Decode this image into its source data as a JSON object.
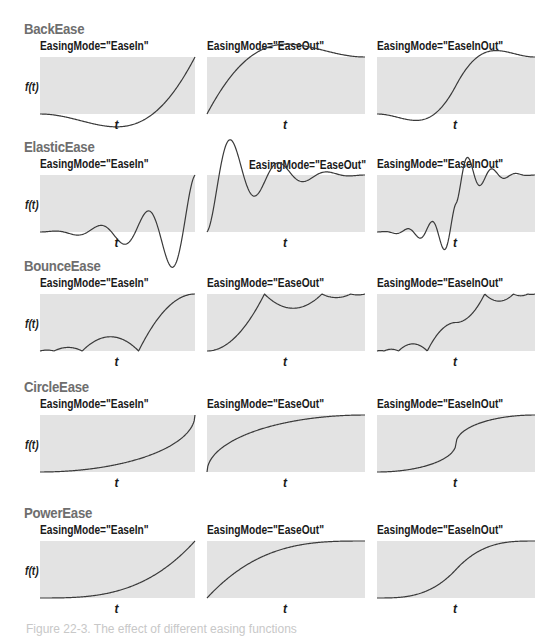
{
  "figure": {
    "y_axis_label": "f(t)",
    "x_axis_label": "t",
    "caption": "Figure 22-3. The effect of different easing functions",
    "colors": {
      "plot_fill": "#e3e3e3",
      "curve": "#3a3a3a",
      "heading": "#6e6e6e"
    }
  },
  "rows": [
    {
      "title": "BackEase",
      "modes": [
        "EasingMode=\"EaseIn\"",
        "EasingMode=\"EaseOut\"",
        "EasingMode=\"EaseInOut\""
      ]
    },
    {
      "title": "ElasticEase",
      "modes": [
        "EasingMode=\"EaseIn\"",
        "EasingMode=\"EaseOut\"",
        "EasingMode=\"EaseInOut\""
      ]
    },
    {
      "title": "BounceEase",
      "modes": [
        "EasingMode=\"EaseIn\"",
        "EasingMode=\"EaseOut\"",
        "EasingMode=\"EaseInOut\""
      ]
    },
    {
      "title": "CircleEase",
      "modes": [
        "EasingMode=\"EaseIn\"",
        "EasingMode=\"EaseOut\"",
        "EasingMode=\"EaseInOut\""
      ]
    },
    {
      "title": "PowerEase",
      "modes": [
        "EasingMode=\"EaseIn\"",
        "EasingMode=\"EaseOut\"",
        "EasingMode=\"EaseInOut\""
      ]
    }
  ],
  "chart_data": {
    "type": "line",
    "title": "Effect of different easing functions",
    "xlabel": "t",
    "ylabel": "f(t)",
    "grid": false,
    "layout": "5 rows (easing function) x 3 columns (EasingMode)",
    "x_range": [
      0,
      1
    ],
    "y_range": [
      0,
      1
    ],
    "series": [
      {
        "name": "BackEase EaseIn",
        "shape": "dips below 0 (~-0.1) then rises to 1"
      },
      {
        "name": "BackEase EaseOut",
        "shape": "rises, overshoots above 1 (~1.1), settles to 1"
      },
      {
        "name": "BackEase EaseInOut",
        "shape": "dips below 0, S-curve, overshoots above 1, settles"
      },
      {
        "name": "ElasticEase EaseIn",
        "shape": "small oscillations near 0 growing, dips well below 0, then shoots to 1"
      },
      {
        "name": "ElasticEase EaseOut",
        "shape": "shoots above 1, damped oscillation settling to 1"
      },
      {
        "name": "ElasticEase EaseInOut",
        "shape": "small oscillation near 0, dip below, rapid rise, overshoot, damped settle to 1"
      },
      {
        "name": "BounceEase EaseIn",
        "shape": "increasing bounces from 0 then final arc to 1"
      },
      {
        "name": "BounceEase EaseOut",
        "shape": "arc to 1 then decreasing bounces at 1"
      },
      {
        "name": "BounceEase EaseInOut",
        "shape": "small bounces near 0, rise, small bounces near 1"
      },
      {
        "name": "CircleEase EaseIn",
        "shape": "flat then vertical rise to 1 at t=1"
      },
      {
        "name": "CircleEase EaseOut",
        "shape": "vertical rise at t=0 then flattens to 1"
      },
      {
        "name": "CircleEase EaseInOut",
        "shape": "steep S-curve around t=0.5"
      },
      {
        "name": "PowerEase EaseIn",
        "shape": "slow start, accelerates to 1"
      },
      {
        "name": "PowerEase EaseOut",
        "shape": "fast start, decelerates to 1"
      },
      {
        "name": "PowerEase EaseInOut",
        "shape": "smooth S-curve"
      }
    ]
  }
}
